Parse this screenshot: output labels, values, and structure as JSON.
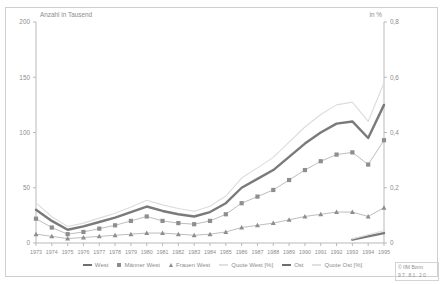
{
  "axes": {
    "left_title": "Anzahl in Tausend",
    "right_title": "in %",
    "left_ticks": [
      "0",
      "50",
      "100",
      "150",
      "200"
    ],
    "right_ticks": [
      "0",
      "0,2",
      "0,4",
      "0,6",
      "0,8"
    ]
  },
  "legend": {
    "items": [
      {
        "label": "West",
        "marker": "line-dark"
      },
      {
        "label": "Männer West",
        "marker": "square"
      },
      {
        "label": "Frauen West",
        "marker": "triangle"
      },
      {
        "label": "Quote West [%]",
        "marker": "line-light"
      },
      {
        "label": "Ost",
        "marker": "line-dark"
      },
      {
        "label": "Quote Ost [%]",
        "marker": "line-light"
      }
    ]
  },
  "credit": {
    "line1": "© IfM Bonn",
    "line2": "97 81 20"
  },
  "chart_data": {
    "type": "line",
    "title": "",
    "xlabel": "",
    "ylabel": "Anzahl in Tausend",
    "y2label": "in %",
    "grid": false,
    "legend_position": "bottom",
    "ylim": [
      0,
      200
    ],
    "y2lim": [
      0,
      0.8
    ],
    "x": [
      "1973",
      "1974",
      "1975",
      "1976",
      "1977",
      "1978",
      "1979",
      "1980",
      "1981",
      "1982",
      "1983",
      "1984",
      "1985",
      "1986",
      "1987",
      "1988",
      "1989",
      "1990",
      "1991",
      "1992",
      "1993",
      "1994",
      "1995"
    ],
    "series": [
      {
        "name": "West",
        "axis": "left",
        "style": "thick-dark-line",
        "values": [
          30,
          20,
          12,
          15,
          19,
          23,
          28,
          33,
          29,
          26,
          24,
          28,
          36,
          50,
          58,
          66,
          78,
          90,
          100,
          108,
          110,
          95,
          125
        ]
      },
      {
        "name": "Männer West",
        "axis": "left",
        "style": "square-marker-line",
        "values": [
          22,
          14,
          8,
          10,
          13,
          16,
          20,
          24,
          20,
          18,
          17,
          20,
          26,
          36,
          42,
          48,
          57,
          66,
          74,
          80,
          82,
          71,
          93
        ]
      },
      {
        "name": "Frauen West",
        "axis": "left",
        "style": "triangle-marker-line",
        "values": [
          8,
          6,
          4,
          5,
          6,
          7,
          8,
          9,
          9,
          8,
          7,
          8,
          10,
          14,
          16,
          18,
          21,
          24,
          26,
          28,
          28,
          24,
          32
        ]
      },
      {
        "name": "Quote West [%]",
        "axis": "right",
        "style": "thin-light-line",
        "values": [
          0.145,
          0.095,
          0.06,
          0.072,
          0.09,
          0.108,
          0.13,
          0.155,
          0.138,
          0.125,
          0.115,
          0.133,
          0.17,
          0.235,
          0.272,
          0.31,
          0.365,
          0.42,
          0.465,
          0.5,
          0.51,
          0.44,
          0.58
        ]
      },
      {
        "name": "Ost",
        "axis": "left",
        "style": "thick-dark-line",
        "values": [
          null,
          null,
          null,
          null,
          null,
          null,
          null,
          null,
          null,
          null,
          null,
          null,
          null,
          null,
          null,
          null,
          null,
          null,
          null,
          null,
          3,
          6,
          9
        ]
      },
      {
        "name": "Quote Ost [%]",
        "axis": "right",
        "style": "thin-light-line",
        "values": [
          null,
          null,
          null,
          null,
          null,
          null,
          null,
          null,
          null,
          null,
          null,
          null,
          null,
          null,
          null,
          null,
          null,
          null,
          null,
          null,
          0.015,
          0.03,
          0.045
        ]
      }
    ]
  }
}
